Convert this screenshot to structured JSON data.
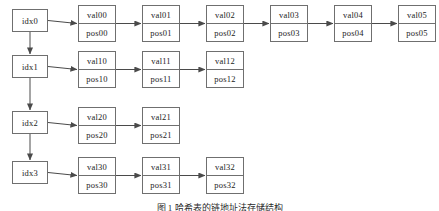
{
  "figure": {
    "caption": "图 1  哈希表的链地址法存储结构",
    "background_color": "#ffffff",
    "line_color": "#6f6f6f",
    "text_color": "#1b1b1b"
  },
  "buckets": [
    {
      "label": "idx0"
    },
    {
      "label": "idx1"
    },
    {
      "label": "idx2"
    },
    {
      "label": "idx3"
    }
  ],
  "chains": [
    {
      "bucket": "idx0",
      "nodes": [
        {
          "val": "val00",
          "pos": "pos00"
        },
        {
          "val": "val01",
          "pos": "pos01"
        },
        {
          "val": "val02",
          "pos": "pos02"
        },
        {
          "val": "val03",
          "pos": "pos03"
        },
        {
          "val": "val04",
          "pos": "pos04"
        },
        {
          "val": "val05",
          "pos": "pos05"
        }
      ]
    },
    {
      "bucket": "idx1",
      "nodes": [
        {
          "val": "val10",
          "pos": "pos10"
        },
        {
          "val": "val11",
          "pos": "pos11"
        },
        {
          "val": "val12",
          "pos": "pos12"
        }
      ]
    },
    {
      "bucket": "idx2",
      "nodes": [
        {
          "val": "val20",
          "pos": "pos20"
        },
        {
          "val": "val21",
          "pos": "pos21"
        }
      ]
    },
    {
      "bucket": "idx3",
      "nodes": [
        {
          "val": "val30",
          "pos": "pos30"
        },
        {
          "val": "val31",
          "pos": "pos31"
        },
        {
          "val": "val32",
          "pos": "pos32"
        }
      ]
    }
  ]
}
